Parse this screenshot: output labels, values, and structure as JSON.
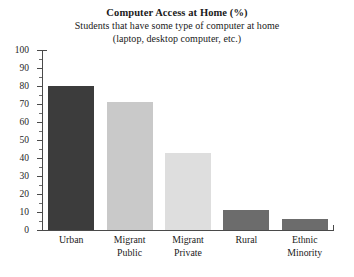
{
  "chart_data": {
    "type": "bar",
    "title": "Computer Access at Home (%)",
    "subtitle_line1": "Students that have some type of computer at home",
    "subtitle_line2": "(laptop, desktop computer, etc.)",
    "xlabel": "",
    "ylabel": "",
    "ylim": [
      0,
      100
    ],
    "ytick_step": 10,
    "grid": false,
    "legend": "none",
    "categories": [
      "Urban",
      "Migrant Public",
      "Migrant Private",
      "Rural",
      "Ethnic Minority"
    ],
    "category_lines": [
      [
        "Urban"
      ],
      [
        "Migrant",
        "Public"
      ],
      [
        "Migrant",
        "Private"
      ],
      [
        "Rural"
      ],
      [
        "Ethnic",
        "Minority"
      ]
    ],
    "values": [
      80,
      71,
      43,
      11,
      6
    ],
    "ytick_labels": [
      "100",
      "90",
      "80",
      "70",
      "60",
      "50",
      "40",
      "30",
      "20",
      "10",
      "0"
    ],
    "bar_colors": [
      "#3c3c3c",
      "#c9c9c9",
      "#dedede",
      "#6c6c6c",
      "#6c6c6c"
    ],
    "axis_color": "#4a4a4a",
    "background": "#ffffff"
  }
}
